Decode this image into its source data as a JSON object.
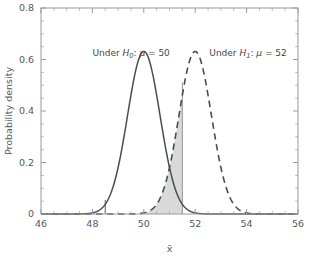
{
  "chart_data": {
    "type": "line",
    "title": "",
    "subtitle": "",
    "xlabel": "x̄",
    "ylabel": "Probability density",
    "xlim": [
      46,
      56
    ],
    "ylim": [
      0,
      0.8
    ],
    "grid": false,
    "legend_position": "none",
    "x_ticks": [
      "46",
      "48",
      "50",
      "52",
      "54",
      "56"
    ],
    "x_tick_values": [
      46,
      48,
      50,
      52,
      54,
      56
    ],
    "x_minor_tick_step": 0.5,
    "y_ticks": [
      "0",
      "0.2",
      "0.4",
      "0.6",
      "0.8"
    ],
    "y_tick_values": [
      0,
      0.2,
      0.4,
      0.6,
      0.8
    ],
    "y_minor_tick_step": 0.05,
    "series": [
      {
        "name": "Under H0 distribution",
        "style": "solid",
        "color": "#4a4d4f",
        "distribution": "normal",
        "mean": 50,
        "sigma": 0.632,
        "peak_density": 0.631,
        "x": [
          46.0,
          46.5,
          47.0,
          47.5,
          48.0,
          48.5,
          49.0,
          49.5,
          50.0,
          50.5,
          51.0,
          51.5,
          52.0,
          52.5,
          53.0,
          53.5,
          54.0,
          54.5,
          55.0,
          55.5,
          56.0
        ],
        "values": [
          0.0,
          0.0,
          0.0,
          0.0001,
          0.0022,
          0.0241,
          0.1413,
          0.4536,
          0.6312,
          0.4536,
          0.1413,
          0.0241,
          0.0022,
          0.0001,
          0.0,
          0.0,
          0.0,
          0.0,
          0.0,
          0.0,
          0.0
        ]
      },
      {
        "name": "Under H1 distribution",
        "style": "dashed",
        "color": "#4a4d4f",
        "distribution": "normal",
        "mean": 52,
        "sigma": 0.632,
        "peak_density": 0.631,
        "x": [
          46.0,
          46.5,
          47.0,
          47.5,
          48.0,
          48.5,
          49.0,
          49.5,
          50.0,
          50.5,
          51.0,
          51.5,
          52.0,
          52.5,
          53.0,
          53.5,
          54.0,
          54.5,
          55.0,
          55.5,
          56.0
        ],
        "values": [
          0.0,
          0.0,
          0.0,
          0.0,
          0.0,
          0.0,
          0.0001,
          0.0022,
          0.0241,
          0.1413,
          0.4536,
          0.6312,
          0.4536,
          0.1413,
          0.0241,
          0.0022,
          0.0001,
          0.0,
          0.0,
          0.0,
          0.0
        ]
      }
    ],
    "shaded_region": {
      "label": "beta-region",
      "under_series": "Under H1 distribution",
      "x_start": 49.9,
      "x_end": 51.5,
      "fill_color": "#d9d9d9",
      "edge_color": "#8c8c8c"
    },
    "vertical_markers": [
      {
        "name": "left-critical-marker",
        "x": 48.5,
        "y_top": 0.055,
        "color": "#4a4d4f"
      },
      {
        "name": "right-critical-marker",
        "x": 51.5,
        "y_top": 0.512,
        "color": "#8c8c8c"
      }
    ],
    "annotations": [
      {
        "name": "under-h0-annotation",
        "prefix": "Under ",
        "symbol": "H",
        "subscript": "0",
        "suffix": ":",
        "mu": "μ",
        "equals": "= 50",
        "full_text": "Under H0: μ = 50",
        "x": 48.0,
        "y": 0.615
      },
      {
        "name": "under-h1-annotation",
        "prefix": "Under ",
        "symbol": "H",
        "subscript": "1",
        "suffix": ":",
        "mu": "μ",
        "equals": "= 52",
        "full_text": "Under H1: μ = 52",
        "x": 52.55,
        "y": 0.615
      }
    ],
    "frame": {
      "box": true,
      "color": "#9a9a9a",
      "tick_direction": "in"
    }
  },
  "colors": {
    "background": "#ffffff",
    "curve": "#4a4d4f",
    "fill": "#d9d9d9",
    "axis": "#9a9a9a",
    "text": "#55595c"
  }
}
